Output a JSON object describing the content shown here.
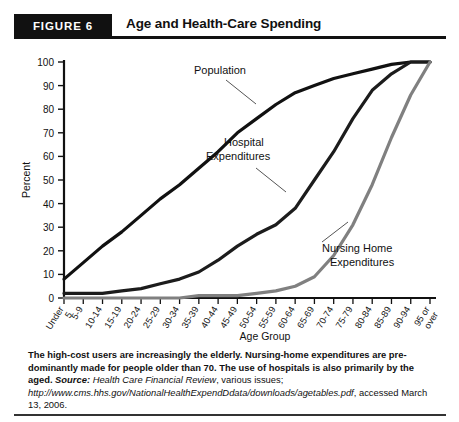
{
  "figure": {
    "badge": "FIGURE 6",
    "title": "Age and Health-Care Spending"
  },
  "caption": {
    "sentence1": "The high-cost users are increasingly the elderly. Nursing-home expenditures are pre-",
    "sentence2": "dominantly made for people older than 70. The use of hospitals is also primarily by",
    "sentence3": "the aged.",
    "source_label": "Source:",
    "source_journal": "Health Care Financial Review",
    "source_mid": ", various issues; ",
    "source_url1": "http://www.cms.hhs.gov/",
    "source_url2": "NationalHealthExpendDdata/downloads/agetables.pdf",
    "source_tail": ", accessed March 13, 2006."
  },
  "chart_data": {
    "type": "line",
    "title": "Age and Health-Care Spending",
    "xlabel": "Age Group",
    "ylabel": "Percent",
    "ylim": [
      0,
      100
    ],
    "yticks": [
      0,
      10,
      20,
      30,
      40,
      50,
      60,
      70,
      80,
      90,
      100
    ],
    "grid": false,
    "legend": "inline-annotations",
    "categories": [
      "Under 5",
      "5-9",
      "10-14",
      "15-19",
      "20-24",
      "25-29",
      "30-34",
      "35-39",
      "40-44",
      "45-49",
      "50-54",
      "55-59",
      "60-64",
      "65-69",
      "70-74",
      "75-79",
      "80-84",
      "85-89",
      "90-94",
      "95 or over"
    ],
    "series": [
      {
        "name": "Population",
        "color": "#111111",
        "values": [
          8,
          15,
          22,
          28,
          35,
          42,
          48,
          55,
          62,
          70,
          76,
          82,
          87,
          90,
          93,
          95,
          97,
          99,
          100,
          100
        ]
      },
      {
        "name": "Hospital Expenditures",
        "color": "#1c1c1c",
        "values": [
          2,
          2,
          2,
          3,
          4,
          6,
          8,
          11,
          16,
          22,
          27,
          31,
          38,
          50,
          62,
          76,
          88,
          95,
          100,
          100
        ]
      },
      {
        "name": "Nursing Home Expenditures",
        "color": "#808080",
        "values": [
          0,
          0,
          0,
          0,
          0,
          0,
          0,
          1,
          1,
          1,
          2,
          3,
          5,
          9,
          18,
          31,
          48,
          68,
          86,
          100
        ]
      }
    ],
    "annotations": [
      {
        "name": "Population",
        "text": "Population"
      },
      {
        "name": "Hospital Expenditures",
        "line1": "Hospital",
        "line2": "Expenditures"
      },
      {
        "name": "Nursing Home Expenditures",
        "line1": "Nursing Home",
        "line2": "Expenditures"
      }
    ]
  }
}
